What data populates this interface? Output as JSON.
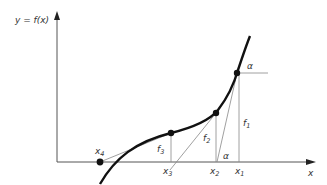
{
  "diagram": {
    "y_axis_label": "y = f(x)",
    "x_axis_label": "x",
    "points": [
      {
        "name": "x1",
        "label": "x",
        "sub": "1"
      },
      {
        "name": "x2",
        "label": "x",
        "sub": "2"
      },
      {
        "name": "x3",
        "label": "x",
        "sub": "3"
      },
      {
        "name": "x4",
        "label": "x",
        "sub": "4"
      }
    ],
    "function_values": [
      {
        "label": "f",
        "sub": "1"
      },
      {
        "label": "f",
        "sub": "2"
      },
      {
        "label": "f",
        "sub": "3"
      }
    ],
    "angle_label": "α",
    "colors": {
      "curve": "#111111",
      "axis": "#555555",
      "construction": "#888888",
      "text": "#333333"
    }
  }
}
